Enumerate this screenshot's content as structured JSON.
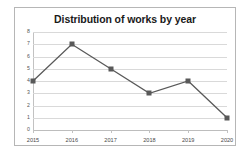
{
  "chart_data": {
    "type": "line",
    "title": "Distribution of works by year",
    "xlabel": "",
    "ylabel": "",
    "categories": [
      "2015",
      "2016",
      "2017",
      "2018",
      "2019",
      "2020"
    ],
    "values": [
      4,
      7,
      5,
      3,
      4,
      1
    ],
    "series": [
      {
        "name": "Works",
        "values": [
          4,
          7,
          5,
          3,
          4,
          1
        ]
      }
    ],
    "ylim": [
      0,
      8
    ],
    "y_ticks": [
      "0",
      "1",
      "2",
      "3",
      "4",
      "5",
      "6",
      "7",
      "8"
    ],
    "grid": "horizontal",
    "legend": "none",
    "marker": "square",
    "colors": {
      "line": "#595959",
      "marker": "#595959",
      "gridline": "#d9d9d9",
      "frame": "#b6b6b6",
      "title_text": "#1a1a1a",
      "tick_text": "#4a4a4a",
      "background": "#ffffff"
    }
  }
}
